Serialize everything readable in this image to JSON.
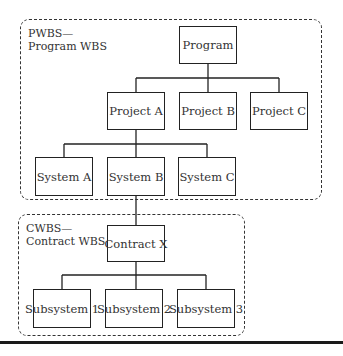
{
  "groups": {
    "pwbs": {
      "label_line1": "PWBS—",
      "label_line2": "Program WBS"
    },
    "cwbs": {
      "label_line1": "CWBS—",
      "label_line2": "Contract WBS"
    }
  },
  "nodes": {
    "program": "Program",
    "project_a": "Project A",
    "project_b": "Project B",
    "project_c": "Project C",
    "system_a": "System A",
    "system_b": "System B",
    "system_c": "System C",
    "contract_x": "Contract X",
    "subsystem_1": "Subsystem 1",
    "subsystem_2": "Subsystem 2",
    "subsystem_3": "Subsystem 3"
  },
  "edges": [
    [
      "program",
      "project_a"
    ],
    [
      "program",
      "project_b"
    ],
    [
      "program",
      "project_c"
    ],
    [
      "project_a",
      "system_a"
    ],
    [
      "project_a",
      "system_b"
    ],
    [
      "project_a",
      "system_c"
    ],
    [
      "system_b",
      "contract_x"
    ],
    [
      "contract_x",
      "subsystem_1"
    ],
    [
      "contract_x",
      "subsystem_2"
    ],
    [
      "contract_x",
      "subsystem_3"
    ]
  ]
}
